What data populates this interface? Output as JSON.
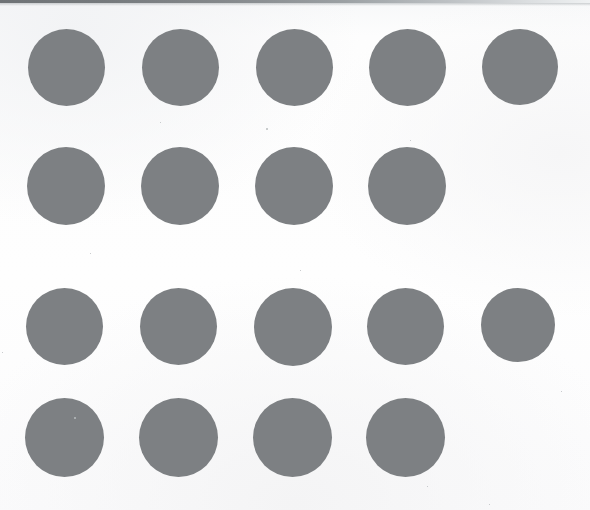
{
  "page": {
    "background_color": "#fdfdfd",
    "width": 590,
    "height": 510,
    "scan_edge_color": "#6f7376"
  },
  "dots": {
    "fill_color": "#7d8083",
    "diameter": 77,
    "total_count": 18,
    "description": "Two groups of gray filled circles, each group has a row of 5 and a row of 4"
  },
  "groups": [
    {
      "name": "upper-group",
      "count": 9,
      "rows": [
        {
          "name": "row-1",
          "count": 5,
          "top": 29,
          "dots": [
            {
              "left": 28,
              "size": 77
            },
            {
              "left": 142,
              "size": 77
            },
            {
              "left": 256,
              "size": 77
            },
            {
              "left": 369,
              "size": 77
            },
            {
              "left": 482,
              "size": 76
            }
          ]
        },
        {
          "name": "row-2",
          "count": 4,
          "top": 147,
          "dots": [
            {
              "left": 27,
              "size": 78
            },
            {
              "left": 141,
              "size": 78
            },
            {
              "left": 255,
              "size": 78
            },
            {
              "left": 368,
              "size": 78
            }
          ]
        }
      ]
    },
    {
      "name": "lower-group",
      "count": 9,
      "rows": [
        {
          "name": "row-3",
          "count": 5,
          "top": 288,
          "dots": [
            {
              "left": 26,
              "size": 77
            },
            {
              "left": 140,
              "size": 77
            },
            {
              "left": 254,
              "size": 78
            },
            {
              "left": 367,
              "size": 77
            },
            {
              "left": 481,
              "size": 74
            }
          ]
        },
        {
          "name": "row-4",
          "count": 4,
          "top": 398,
          "dots": [
            {
              "left": 25,
              "size": 79
            },
            {
              "left": 139,
              "size": 79
            },
            {
              "left": 253,
              "size": 79
            },
            {
              "left": 366,
              "size": 79
            }
          ]
        }
      ]
    }
  ],
  "specks": [
    {
      "left": 266,
      "top": 128,
      "size": 2
    },
    {
      "left": 160,
      "top": 122,
      "size": 1
    },
    {
      "left": 410,
      "top": 140,
      "size": 1
    },
    {
      "left": 90,
      "top": 253,
      "size": 1
    },
    {
      "left": 300,
      "top": 270,
      "size": 1
    },
    {
      "left": 74,
      "top": 417,
      "size": 2
    },
    {
      "left": 427,
      "top": 486,
      "size": 1
    },
    {
      "left": 561,
      "top": 391,
      "size": 1
    },
    {
      "left": 2,
      "top": 352,
      "size": 1
    },
    {
      "left": 489,
      "top": 504,
      "size": 1
    }
  ]
}
